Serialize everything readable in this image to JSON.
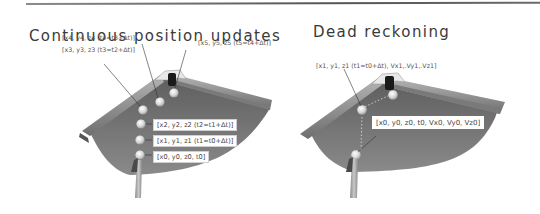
{
  "figure": {
    "left_panel": {
      "title": "Continuous position updates",
      "labels": {
        "p5": "[x5, y5, z5 (t5=t4+Δt)]",
        "p4": "[x4, y4, z4 (t4=t3+Δt)]",
        "p3": "[x3, y3, z3 (t3=t2+Δt)]",
        "p2": "[x2, y2, z2 (t2=t1+Δt)]",
        "p1": "[x1, y1, z1 (t1=t0+Δt)]",
        "p0": "[x0, y0, z0, t0]"
      }
    },
    "right_panel": {
      "title": "Dead reckoning",
      "labels": {
        "p1": "[x1, y1, z1 (t1=t0+Δt), Vx1,.Vy1,.Vz1]",
        "p0": "[x0, y0, z0, t0, Vx0, Vy0, Vz0]"
      }
    },
    "colors": {
      "table_felt": "#6b6b6b",
      "rail": "#8c8c8c",
      "pocket": "#1a1a1a",
      "ball": "#d9d9d9",
      "cue": "#a6a6a6",
      "rule": "#666666"
    }
  }
}
